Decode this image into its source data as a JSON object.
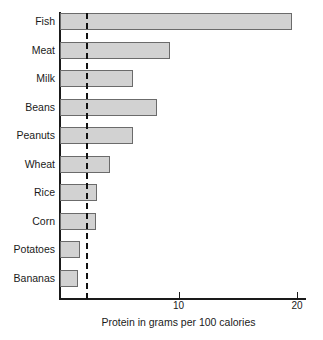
{
  "chart_data": {
    "type": "bar",
    "orientation": "horizontal",
    "title": "",
    "subtitle": "",
    "xlabel": "Protein in grams per 100 calories",
    "ylabel": "",
    "categories": [
      "Fish",
      "Meat",
      "Milk",
      "Beans",
      "Peanuts",
      "Wheat",
      "Rice",
      "Corn",
      "Potatoes",
      "Bananas"
    ],
    "values": [
      19.6,
      9.3,
      6.2,
      8.2,
      6.2,
      4.2,
      3.1,
      3.0,
      1.7,
      1.5
    ],
    "xlim": [
      0,
      20
    ],
    "xticks": [
      10,
      20
    ],
    "xtick_labels": [
      "10",
      "20"
    ],
    "grid": false,
    "legend": null,
    "annotations": [
      {
        "name": "reference-line",
        "type": "vertical-dashed-line",
        "value": 2.2,
        "label": ""
      }
    ],
    "bar_fill_color": "#d2d2d2",
    "bar_border_color": "#6b6b6b",
    "axis_color": "#1a1a1a"
  },
  "axis": {
    "x_title": "Protein in grams per 100 calories",
    "ticks": [
      {
        "label": "10",
        "value": 10
      },
      {
        "label": "20",
        "value": 20
      }
    ]
  }
}
